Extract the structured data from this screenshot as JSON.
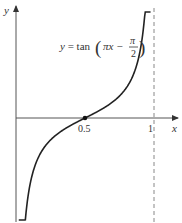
{
  "chart_data": {
    "type": "line",
    "title": "",
    "annotation": {
      "prefix": "y = tan",
      "arg_main": "πx −",
      "frac_num": "π",
      "frac_den": "2"
    },
    "xlabel": "x",
    "ylabel": "y",
    "xlim": [
      -0.02,
      1.08
    ],
    "ylim": [
      -5,
      4.5
    ],
    "x_ticks": [
      {
        "value": 0.5,
        "label": "0.5"
      },
      {
        "value": 1,
        "label": "1"
      }
    ],
    "marked_point": {
      "x": 0.5,
      "y": 0
    },
    "asymptote_x": 1,
    "function": "tan(pi*x - pi/2)",
    "domain": [
      0.02,
      0.975
    ],
    "grid": false,
    "colors": {
      "curve": "#222222",
      "axis": "#444444",
      "asymptote": "#888888"
    }
  }
}
